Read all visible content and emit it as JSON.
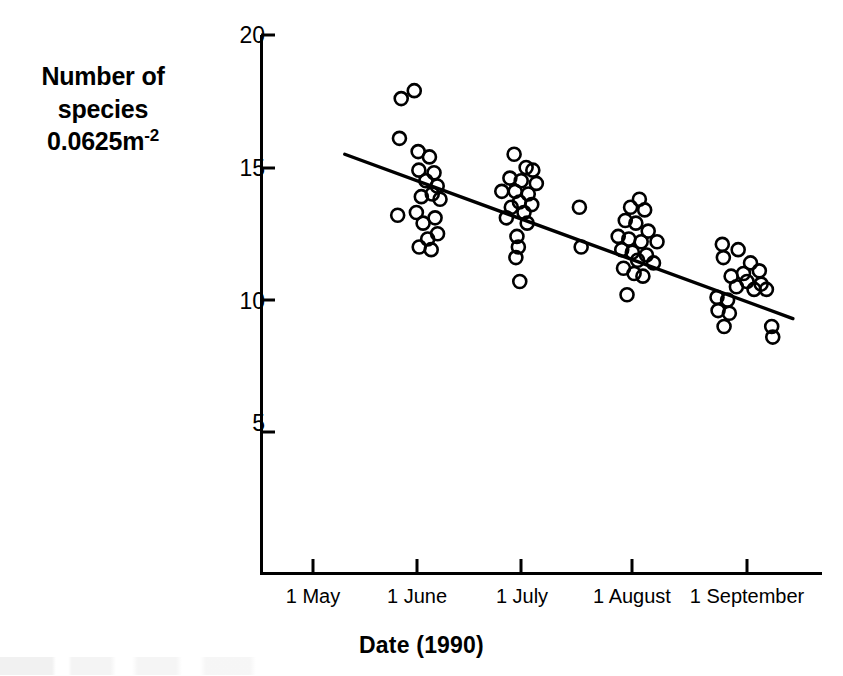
{
  "figure": {
    "background_color": "#ffffff",
    "ink_color": "#000000"
  },
  "axis_titles": {
    "y_line1": "Number of",
    "y_line2": "species",
    "y_line3_base": "0.0625m",
    "y_line3_exponent": "-2",
    "x_title": "Date (1990)"
  },
  "chart_data": {
    "type": "scatter",
    "title": "",
    "subtitle": "",
    "xlabel": "Date (1990)",
    "ylabel": "Number of species 0.0625m-2",
    "grid": false,
    "legend": "none",
    "xlim": [
      0,
      140
    ],
    "ylim": [
      0,
      20.8
    ],
    "ytick_values": [
      20,
      15,
      10,
      5
    ],
    "ytick_labels": [
      "20",
      "15",
      "10",
      "5"
    ],
    "xtick_values": [
      0,
      31,
      61,
      92,
      123
    ],
    "xtick_labels": [
      "1 May",
      "1 June",
      "1 July",
      "1 August",
      "1 September"
    ],
    "x_unit": "days since 1 May 1990",
    "series": [
      {
        "name": "Number of species per 0.0625 m^2 quadrat",
        "marker": "open-circle",
        "marker_size_px": 13,
        "points": [
          [
            25.0,
            17.6
          ],
          [
            28.7,
            17.9
          ],
          [
            24.5,
            16.1
          ],
          [
            29.8,
            15.6
          ],
          [
            33.0,
            15.4
          ],
          [
            30.0,
            14.9
          ],
          [
            34.3,
            14.8
          ],
          [
            32.0,
            14.5
          ],
          [
            35.2,
            14.3
          ],
          [
            33.8,
            14.0
          ],
          [
            30.7,
            13.9
          ],
          [
            36.0,
            13.8
          ],
          [
            29.3,
            13.3
          ],
          [
            24.0,
            13.2
          ],
          [
            34.6,
            13.1
          ],
          [
            31.2,
            12.9
          ],
          [
            35.3,
            12.5
          ],
          [
            32.5,
            12.3
          ],
          [
            30.1,
            12.0
          ],
          [
            33.5,
            11.9
          ],
          [
            57.0,
            15.5
          ],
          [
            60.4,
            15.0
          ],
          [
            62.3,
            14.9
          ],
          [
            55.8,
            14.6
          ],
          [
            59.0,
            14.5
          ],
          [
            63.3,
            14.4
          ],
          [
            53.5,
            14.1
          ],
          [
            57.3,
            14.1
          ],
          [
            61.0,
            14.0
          ],
          [
            58.5,
            13.7
          ],
          [
            62.0,
            13.6
          ],
          [
            56.2,
            13.5
          ],
          [
            59.8,
            13.3
          ],
          [
            54.8,
            13.1
          ],
          [
            60.7,
            12.9
          ],
          [
            57.8,
            12.4
          ],
          [
            58.2,
            12.0
          ],
          [
            57.5,
            11.6
          ],
          [
            58.6,
            10.7
          ],
          [
            75.5,
            13.5
          ],
          [
            76.0,
            12.0
          ],
          [
            92.5,
            13.8
          ],
          [
            90.0,
            13.5
          ],
          [
            94.0,
            13.4
          ],
          [
            88.5,
            13.0
          ],
          [
            91.5,
            12.9
          ],
          [
            95.0,
            12.6
          ],
          [
            86.5,
            12.4
          ],
          [
            89.5,
            12.3
          ],
          [
            93.0,
            12.2
          ],
          [
            97.5,
            12.2
          ],
          [
            87.5,
            11.9
          ],
          [
            90.5,
            11.8
          ],
          [
            94.5,
            11.7
          ],
          [
            92.0,
            11.5
          ],
          [
            96.5,
            11.4
          ],
          [
            88.0,
            11.2
          ],
          [
            91.0,
            11.0
          ],
          [
            93.5,
            10.9
          ],
          [
            89.0,
            10.2
          ],
          [
            116.0,
            12.1
          ],
          [
            116.3,
            11.6
          ],
          [
            120.5,
            11.9
          ],
          [
            124.0,
            11.4
          ],
          [
            122.0,
            11.0
          ],
          [
            126.5,
            11.1
          ],
          [
            118.5,
            10.9
          ],
          [
            123.0,
            10.7
          ],
          [
            127.0,
            10.6
          ],
          [
            120.0,
            10.5
          ],
          [
            125.0,
            10.4
          ],
          [
            128.5,
            10.4
          ],
          [
            114.5,
            10.1
          ],
          [
            117.5,
            10.0
          ],
          [
            114.8,
            9.6
          ],
          [
            118.0,
            9.5
          ],
          [
            116.5,
            9.0
          ],
          [
            130.0,
            9.0
          ],
          [
            130.3,
            8.6
          ]
        ]
      }
    ],
    "trend_line": {
      "type": "linear-regression",
      "x_start": 9.0,
      "y_start": 15.5,
      "x_end": 136.0,
      "y_end": 9.3,
      "style": "solid"
    }
  }
}
